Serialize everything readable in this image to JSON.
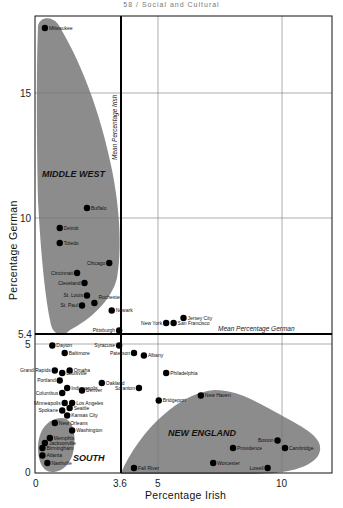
{
  "header": "58 / Social and Cultural",
  "chart_data": {
    "type": "scatter",
    "title": "",
    "xlabel": "Percentage Irish",
    "ylabel": "Percentage German",
    "xlim": [
      0,
      12
    ],
    "ylim": [
      0,
      18.2
    ],
    "x_ticks": [
      "0",
      "3.6",
      "5",
      "10"
    ],
    "y_ticks": [
      "0",
      "5",
      "5.4",
      "10",
      "15"
    ],
    "grid": true,
    "reference_lines": [
      {
        "axis": "x",
        "value": 3.6,
        "label": "Mean Percentage Irish"
      },
      {
        "axis": "y",
        "value": 5.4,
        "label": "Mean Percentage German"
      }
    ],
    "regions": [
      {
        "name": "MIDDLE WEST"
      },
      {
        "name": "SOUTH"
      },
      {
        "name": "NEW ENGLAND"
      }
    ],
    "points": [
      {
        "city": "Milwaukee",
        "x": 0.4,
        "y": 17.8
      },
      {
        "city": "Buffalo",
        "x": 2.1,
        "y": 10.6
      },
      {
        "city": "Detroit",
        "x": 1.0,
        "y": 9.8
      },
      {
        "city": "Toledo",
        "x": 1.0,
        "y": 9.2
      },
      {
        "city": "Chicago",
        "x": 3.0,
        "y": 8.4
      },
      {
        "city": "Cincinnati",
        "x": 1.7,
        "y": 8.0
      },
      {
        "city": "Cleveland",
        "x": 2.0,
        "y": 7.6
      },
      {
        "city": "St. Louis",
        "x": 2.1,
        "y": 7.1
      },
      {
        "city": "St. Paul",
        "x": 1.9,
        "y": 6.7
      },
      {
        "city": "Rochester",
        "x": 2.4,
        "y": 6.8
      },
      {
        "city": "Newark",
        "x": 3.1,
        "y": 6.5
      },
      {
        "city": "New York",
        "x": 5.3,
        "y": 6.0
      },
      {
        "city": "San Francisco",
        "x": 5.6,
        "y": 6.0
      },
      {
        "city": "Jersey City",
        "x": 6.0,
        "y": 6.2
      },
      {
        "city": "Pittsburgh",
        "x": 3.4,
        "y": 5.7
      },
      {
        "city": "Syracuse",
        "x": 3.4,
        "y": 5.1
      },
      {
        "city": "Dayton",
        "x": 0.7,
        "y": 5.1
      },
      {
        "city": "Baltimore",
        "x": 1.2,
        "y": 4.8
      },
      {
        "city": "Paterson",
        "x": 4.0,
        "y": 4.8
      },
      {
        "city": "Albany",
        "x": 4.4,
        "y": 4.7
      },
      {
        "city": "Philadelphia",
        "x": 5.3,
        "y": 4.0
      },
      {
        "city": "Grand Rapids",
        "x": 0.8,
        "y": 4.1
      },
      {
        "city": "Omaha",
        "x": 1.4,
        "y": 4.1
      },
      {
        "city": "Louisville",
        "x": 1.1,
        "y": 4.0
      },
      {
        "city": "Portland",
        "x": 1.0,
        "y": 3.7
      },
      {
        "city": "Oakland",
        "x": 2.7,
        "y": 3.6
      },
      {
        "city": "Indianapolis",
        "x": 1.3,
        "y": 3.4
      },
      {
        "city": "Denver",
        "x": 1.9,
        "y": 3.3
      },
      {
        "city": "Columbus",
        "x": 1.1,
        "y": 3.2
      },
      {
        "city": "Scranton",
        "x": 4.2,
        "y": 3.4
      },
      {
        "city": "Bridgeport",
        "x": 5.0,
        "y": 2.9
      },
      {
        "city": "New Haven",
        "x": 6.7,
        "y": 3.1
      },
      {
        "city": "Minneapolis",
        "x": 1.2,
        "y": 2.8
      },
      {
        "city": "Los Angeles",
        "x": 1.5,
        "y": 2.8
      },
      {
        "city": "Seattle",
        "x": 1.4,
        "y": 2.6
      },
      {
        "city": "Spokane",
        "x": 1.1,
        "y": 2.5
      },
      {
        "city": "Kansas City",
        "x": 1.3,
        "y": 2.3
      },
      {
        "city": "New Orleans",
        "x": 0.8,
        "y": 2.0
      },
      {
        "city": "Washington",
        "x": 1.5,
        "y": 1.7
      },
      {
        "city": "Memphis",
        "x": 0.6,
        "y": 1.4
      },
      {
        "city": "Jacksonville",
        "x": 0.4,
        "y": 1.2
      },
      {
        "city": "Birmingham",
        "x": 0.3,
        "y": 1.0
      },
      {
        "city": "Atlanta",
        "x": 0.3,
        "y": 0.7
      },
      {
        "city": "Nashville",
        "x": 0.5,
        "y": 0.4
      },
      {
        "city": "Fall River",
        "x": 4.0,
        "y": 0.2
      },
      {
        "city": "Worcester",
        "x": 7.2,
        "y": 0.4
      },
      {
        "city": "Providence",
        "x": 8.0,
        "y": 1.0
      },
      {
        "city": "Lowell",
        "x": 9.4,
        "y": 0.2
      },
      {
        "city": "Boston",
        "x": 9.8,
        "y": 1.3
      },
      {
        "city": "Cambridge",
        "x": 10.1,
        "y": 1.0
      }
    ]
  },
  "labels": {
    "x_axis": "Percentage Irish",
    "y_axis": "Percentage German",
    "mean_irish": "Mean Percentage Irish",
    "mean_german": "Mean Percentage German",
    "region_midwest": "MIDDLE WEST",
    "region_south": "SOUTH",
    "region_newengland": "NEW ENGLAND",
    "tick_x_0": "0",
    "tick_x_36": "3.6",
    "tick_x_5": "5",
    "tick_x_10": "10",
    "tick_y_0": "0",
    "tick_y_5": "5",
    "tick_y_54": "5.4",
    "tick_y_10": "10",
    "tick_y_15": "15"
  },
  "colors": {
    "region_fill": "#8c8c8c",
    "point": "#000000",
    "grid": "#777777",
    "mean_line": "#000000"
  }
}
